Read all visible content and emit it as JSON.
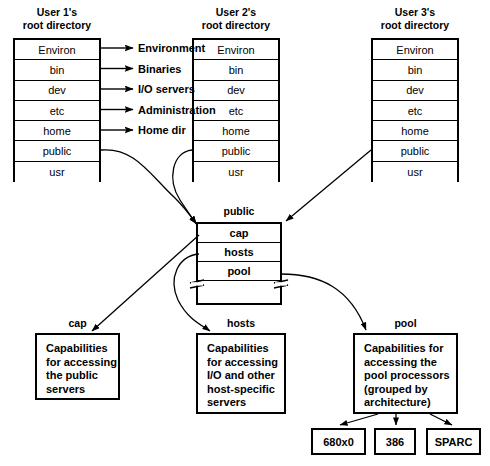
{
  "diagram": {
    "title_hidden": "Public directory and capability structure",
    "columns": [
      {
        "title_line1": "User 1's",
        "title_line2": "root directory",
        "entries": [
          "Environ",
          "bin",
          "dev",
          "etc",
          "home",
          "public",
          "usr"
        ]
      },
      {
        "title_line1": "User 2's",
        "title_line2": "root directory",
        "entries": [
          "Environ",
          "bin",
          "dev",
          "etc",
          "home",
          "public",
          "usr"
        ]
      },
      {
        "title_line1": "User 3's",
        "title_line2": "root directory",
        "entries": [
          "Environ",
          "bin",
          "dev",
          "etc",
          "home",
          "public",
          "usr"
        ]
      }
    ],
    "side_labels": [
      "Environment",
      "Binaries",
      "I/O servers",
      "Administration",
      "Home dir"
    ],
    "public_node": {
      "caption": "public",
      "entries": [
        "cap",
        "hosts",
        "pool"
      ]
    },
    "detail_boxes": [
      {
        "caption": "cap",
        "lines": [
          "Capabilities",
          "for accessing",
          "the public",
          "servers"
        ]
      },
      {
        "caption": "hosts",
        "lines": [
          "Capabilities",
          "for accessing",
          "I/O and other",
          "host-specific",
          "servers"
        ]
      },
      {
        "caption": "pool",
        "lines": [
          "Capabilities for",
          "accessing the",
          "pool processors",
          "(grouped by",
          "architecture)"
        ]
      }
    ],
    "architectures": [
      "680x0",
      "386",
      "SPARC"
    ],
    "colors": {
      "line": "#000000",
      "background": "#ffffff",
      "text": "#000000"
    }
  }
}
